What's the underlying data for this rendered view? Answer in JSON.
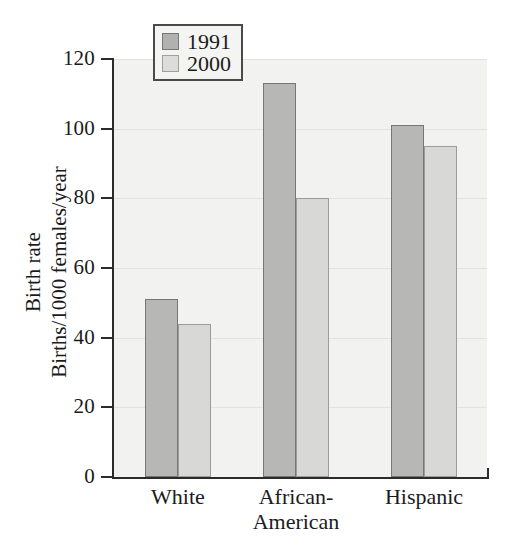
{
  "chart_data": {
    "type": "bar",
    "title": "",
    "subtitle": "",
    "xlabel": "",
    "ylabel": "Birth rate\nBirths/1000 females/year",
    "ylabel_lines": [
      "Birth rate",
      "Births/1000 females/year"
    ],
    "categories": [
      "White",
      "African-American",
      "Hispanic"
    ],
    "category_label_lines": [
      [
        "White"
      ],
      [
        "African-",
        "American"
      ],
      [
        "Hispanic"
      ]
    ],
    "series": [
      {
        "name": "1991",
        "values": [
          51,
          113,
          101
        ],
        "color": "#b7b7b5"
      },
      {
        "name": "2000",
        "values": [
          44,
          80,
          95
        ],
        "color": "#d8d8d6"
      }
    ],
    "ylim": [
      0,
      120
    ],
    "yticks": [
      0,
      20,
      40,
      60,
      80,
      100,
      120
    ],
    "ytick_labels": [
      "0",
      "20",
      "40",
      "60",
      "80",
      "100",
      "120"
    ],
    "grid": true,
    "grid_axis": "y",
    "legend_position": "top-left-inside",
    "bar_group_gap": true
  },
  "legend": {
    "entries": [
      {
        "label": "1991",
        "swatch": "series-0-swatch"
      },
      {
        "label": "2000",
        "swatch": "series-1-swatch"
      }
    ]
  },
  "colors": {
    "series_1991": "#b7b7b5",
    "series_2000": "#d8d8d6",
    "axis": "#2b2b2b",
    "plot_background": "#f2f2f0",
    "gridline": "#e2e2de",
    "page_background": "#ffffff"
  }
}
